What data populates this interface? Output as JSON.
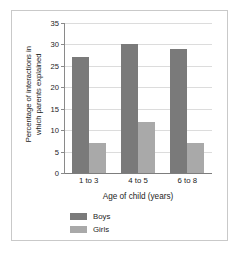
{
  "chart_data": {
    "type": "bar",
    "title": "",
    "xlabel": "Age of child (years)",
    "ylabel": "Percentage of interactions in which parents explained",
    "ylabel_line1": "Percentage of interactions in",
    "ylabel_line2": "which parents explained",
    "categories": [
      "1 to 3",
      "4 to 5",
      "6 to 8"
    ],
    "series": [
      {
        "name": "Boys",
        "color": "#7a7a7a",
        "values": [
          27,
          30,
          29
        ]
      },
      {
        "name": "Girls",
        "color": "#a9a9a9",
        "values": [
          7,
          12,
          7
        ]
      }
    ],
    "ylim": [
      0,
      35
    ],
    "yticks": [
      0,
      5,
      10,
      15,
      20,
      25,
      30,
      35
    ],
    "ytick_labels": [
      "0",
      "5",
      "10",
      "15",
      "20",
      "25",
      "30",
      "35"
    ],
    "grid": true,
    "legend_position": "bottom-left",
    "frame": true,
    "frame_color": "#c9c9c9"
  }
}
